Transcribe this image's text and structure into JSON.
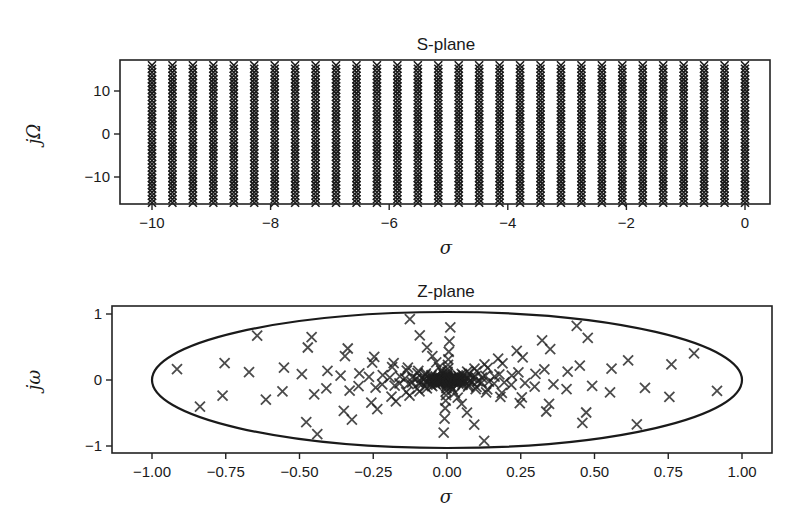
{
  "chart_data": [
    {
      "type": "scatter",
      "title": "S-plane",
      "xlabel": "σ",
      "ylabel": "jΩ",
      "xlim": [
        -10.5,
        0.45
      ],
      "ylim": [
        -16.5,
        16.5
      ],
      "xticks": [
        -10,
        -8,
        -6,
        -4,
        -2,
        0
      ],
      "xtick_labels": [
        "−10",
        "−8",
        "−6",
        "−4",
        "−2",
        "0"
      ],
      "yticks": [
        10,
        0,
        -10
      ],
      "ytick_labels": [
        "10",
        "0",
        "−10"
      ],
      "grid": false,
      "marker": "x",
      "series": [
        {
          "name": "poles",
          "description": "dense grid of points: sigma from -10 to 0 in 30 columns, jOmega from -16 to 16",
          "sigma_start": -10,
          "sigma_end": 0,
          "sigma_count": 30,
          "omega_start": -16,
          "omega_end": 16,
          "omega_count": 40
        }
      ]
    },
    {
      "type": "scatter",
      "title": "Z-plane",
      "xlabel": "σ",
      "ylabel": "jω",
      "xlim": [
        -1.1,
        1.1
      ],
      "ylim": [
        -1.1,
        1.1
      ],
      "xticks": [
        -1.0,
        -0.75,
        -0.5,
        -0.25,
        0.0,
        0.25,
        0.5,
        0.75,
        1.0
      ],
      "xtick_labels": [
        "−1.00",
        "−0.75",
        "−0.50",
        "−0.25",
        "0.00",
        "0.25",
        "0.50",
        "0.75",
        "1.00"
      ],
      "yticks": [
        1,
        0,
        -1
      ],
      "ytick_labels": [
        "1",
        "0",
        "−1"
      ],
      "grid": false,
      "marker": "x",
      "unit_circle": true,
      "series": [
        {
          "name": "mapped poles",
          "description": "points inside unit circle, concentric rings z = exp(sigma_k)·exp(j·theta), dense near origin",
          "ring_radii_example": [
            0.93,
            0.87,
            0.76,
            0.66,
            0.63,
            0.56,
            0.5,
            0.46,
            0.36,
            0.34,
            0.27,
            0.2
          ],
          "angles_per_ring": 10
        }
      ]
    }
  ]
}
